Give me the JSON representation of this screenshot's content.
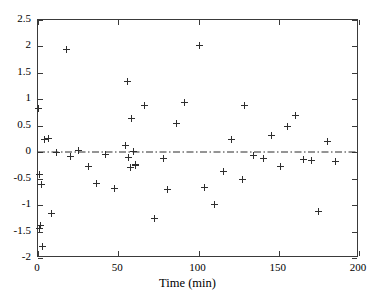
{
  "chart_data": {
    "type": "scatter",
    "title": "",
    "xlabel": "Time (min)",
    "ylabel": "",
    "xlim": [
      0,
      200
    ],
    "ylim": [
      -2,
      2.5
    ],
    "xticks": [
      0,
      50,
      100,
      150,
      200
    ],
    "yticks": [
      -2,
      -1.5,
      -1,
      -0.5,
      0,
      0.5,
      1,
      1.5,
      2,
      2.5
    ],
    "xtick_labels": [
      "0",
      "50",
      "100",
      "150",
      "200"
    ],
    "ytick_labels": [
      "-2",
      "-1.5",
      "-1",
      "-0.5",
      "0",
      "0.5",
      "1",
      "1.5",
      "2",
      "2.5"
    ],
    "grid": false,
    "legend": null,
    "marker": "plus",
    "marker_color": "#2e2e2e",
    "reference_line": {
      "orientation": "horizontal",
      "y": 0,
      "style": "dash-dot",
      "color": "#2b2b2b"
    },
    "series": [
      {
        "name": "residuals",
        "x": [
          0.5,
          0.8,
          1.2,
          1.5,
          2.0,
          2.5,
          4.0,
          6.5,
          8.5,
          11.5,
          17.5,
          20.5,
          25.5,
          31.5,
          36.5,
          42.0,
          47.5,
          54.5,
          55.5,
          56.5,
          57.5,
          58.5,
          59.5,
          60.5,
          61.0,
          66.5,
          72.5,
          78.5,
          80.5,
          86.5,
          91.5,
          100.5,
          103.5,
          110.0,
          115.5,
          120.5,
          127.5,
          128.5,
          134.5,
          140.5,
          145.5,
          151.0,
          155.5,
          160.5,
          165.5,
          170.5,
          175.0,
          180.5,
          185.5
        ],
        "y": [
          0.83,
          -0.42,
          -1.45,
          -1.38,
          -0.61,
          -1.78,
          0.24,
          0.26,
          -1.16,
          0.0,
          1.94,
          -0.09,
          0.03,
          -0.27,
          -0.59,
          -0.05,
          -0.68,
          0.13,
          1.34,
          -0.1,
          -0.28,
          0.63,
          0.02,
          -0.23,
          -0.26,
          0.88,
          -1.25,
          -0.12,
          -0.71,
          0.54,
          0.94,
          2.01,
          -0.66,
          -0.99,
          -0.36,
          0.25,
          -0.52,
          0.89,
          -0.06,
          -0.12,
          0.31,
          -0.27,
          0.48,
          0.69,
          -0.13,
          -0.16,
          -1.12,
          0.21,
          -0.17
        ]
      }
    ]
  },
  "axis": {
    "x_title": "Time (min)"
  }
}
